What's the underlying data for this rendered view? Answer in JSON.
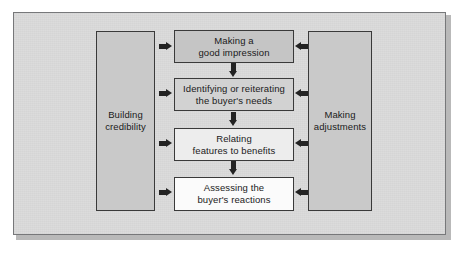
{
  "diagram": {
    "background_color": "#dcdcdc",
    "frame_border_color": "#77787a",
    "arrow_color": "#232323",
    "columns": {
      "left": {
        "label": "Building\ncredibility",
        "fill": "#c9c9c9"
      },
      "right": {
        "label": "Making\nadjustments",
        "fill": "#c9c9c9"
      }
    },
    "steps": [
      {
        "id": "step-1",
        "label": "Making a\ngood impression",
        "fill": "#c5c5c5"
      },
      {
        "id": "step-2",
        "label": "Identifying or reiterating\nthe buyer's needs",
        "fill": "#d2d2d2"
      },
      {
        "id": "step-3",
        "label": "Relating\nfeatures to benefits",
        "fill": "#ededed"
      },
      {
        "id": "step-4",
        "label": "Assessing the\nbuyer's reactions",
        "fill": "#fbfbfb"
      }
    ],
    "arrows": {
      "left_to_step": "arrow-right-icon",
      "right_to_step": "arrow-left-icon",
      "step_to_step": "arrow-down-icon"
    }
  }
}
